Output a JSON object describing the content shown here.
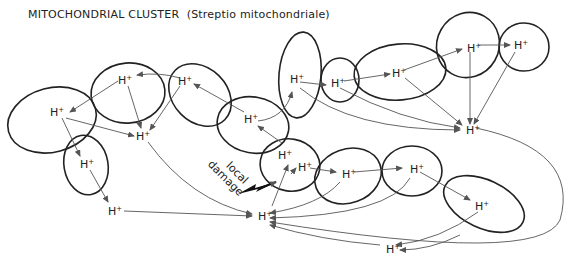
{
  "title": "MITOCHONDRIAL CLUSTER",
  "subtitle": "(Streptio mitochondriale)",
  "damage_label": [
    "local",
    "damage"
  ],
  "ion_label": "H",
  "ion_charge": "+",
  "colors": {
    "outline": "#222222",
    "arrow": "#555555",
    "background": "#ffffff"
  },
  "nodes": [
    {
      "id": "n1",
      "x": 56,
      "y": 112
    },
    {
      "id": "n2",
      "x": 124,
      "y": 80
    },
    {
      "id": "n3",
      "x": 184,
      "y": 81
    },
    {
      "id": "n4",
      "x": 141,
      "y": 135
    },
    {
      "id": "n5",
      "x": 85,
      "y": 163
    },
    {
      "id": "n6",
      "x": 112,
      "y": 209
    },
    {
      "id": "n7",
      "x": 248,
      "y": 118
    },
    {
      "id": "n8",
      "x": 295,
      "y": 78
    },
    {
      "id": "n9",
      "x": 335,
      "y": 81
    },
    {
      "id": "n10",
      "x": 396,
      "y": 72
    },
    {
      "id": "n11",
      "x": 470,
      "y": 46
    },
    {
      "id": "n12",
      "x": 518,
      "y": 44
    },
    {
      "id": "n13",
      "x": 466,
      "y": 128
    },
    {
      "id": "n14",
      "x": 280,
      "y": 153
    },
    {
      "id": "n15",
      "x": 303,
      "y": 165
    },
    {
      "id": "n16",
      "x": 344,
      "y": 172
    },
    {
      "id": "n17",
      "x": 410,
      "y": 168
    },
    {
      "id": "n18",
      "x": 478,
      "y": 205
    },
    {
      "id": "n19",
      "x": 261,
      "y": 215
    },
    {
      "id": "n20",
      "x": 388,
      "y": 247
    }
  ]
}
